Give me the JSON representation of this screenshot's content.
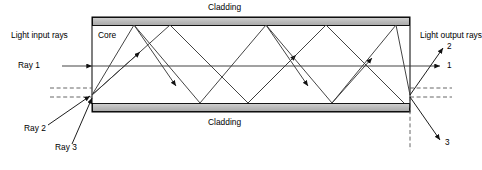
{
  "diagram": {
    "labels": {
      "cladding_top": "Cladding",
      "cladding_bottom": "Cladding",
      "core": "Core",
      "light_input_rays": "Light input rays",
      "light_output_rays": "Light output rays",
      "ray1_in": "Ray 1",
      "ray2_in": "Ray 2",
      "ray3_in": "Ray 3",
      "out1": "1",
      "out2": "2",
      "out3": "3"
    },
    "colors": {
      "cladding_fill": "#bfbfbf",
      "core_fill": "#ffffff",
      "stroke": "#000000",
      "ray_stroke": "#3a3a3a",
      "background": "#ffffff",
      "dashed": "#555555"
    },
    "geometry": {
      "fiber_left": 92,
      "fiber_right": 410,
      "clad_top_y": 17,
      "clad_top_bottom_y": 25,
      "clad_bot_y": 103,
      "clad_bot_bottom_y": 112,
      "core_top_y": 25,
      "core_bottom_y": 103,
      "entry_point_x": 92,
      "entry_point_y": 95,
      "exit_point_x": 410,
      "exit_point_y": 95,
      "ray1_axis_y": 66
    },
    "rays": [
      {
        "name": "ray-1",
        "description": "axial ray travelling straight along fiber axis",
        "path": "M 30,66 L 410,66",
        "output_angle": "horizontal"
      },
      {
        "name": "ray-2",
        "description": "low-angle ray, total internal reflection, few bounces",
        "path": "M 92,95 L 170,25 L 248,103 L 326,25 L 404,103",
        "output_angle": "upward"
      },
      {
        "name": "ray-3",
        "description": "high-angle ray, total internal reflection, more bounces",
        "path": "M 92,95 L 134,25 L 200,103 L 266,25 L 332,103 L 396,25 L 410,95",
        "output_angle": "downward"
      }
    ]
  }
}
